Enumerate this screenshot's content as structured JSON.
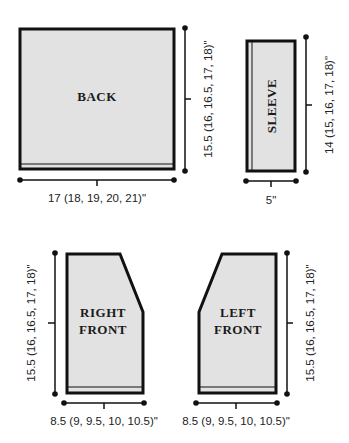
{
  "diagram": {
    "type": "knitting schematic",
    "pieces": [
      {
        "id": "back",
        "label": "BACK",
        "width_label": "17 (18, 19, 20, 21)\"",
        "height_label": "15.5 (16, 16.5, 17, 18)\""
      },
      {
        "id": "sleeve",
        "label": "SLEEVE",
        "width_label": "5\"",
        "height_label": "14 (15, 16, 17, 18)\""
      },
      {
        "id": "right-front",
        "label_line1": "RIGHT",
        "label_line2": "FRONT",
        "width_label": "8.5 (9, 9.5, 10, 10.5)\"",
        "height_label": "15.5 (16, 16.5, 17, 18)\""
      },
      {
        "id": "left-front",
        "label_line1": "LEFT",
        "label_line2": "FRONT",
        "width_label": "8.5 (9, 9.5, 10, 10.5)\"",
        "height_label": "15.5 (16, 16.5, 17, 18)\""
      }
    ]
  },
  "colors": {
    "fill": "#e2e2e2",
    "stroke": "#111111"
  }
}
